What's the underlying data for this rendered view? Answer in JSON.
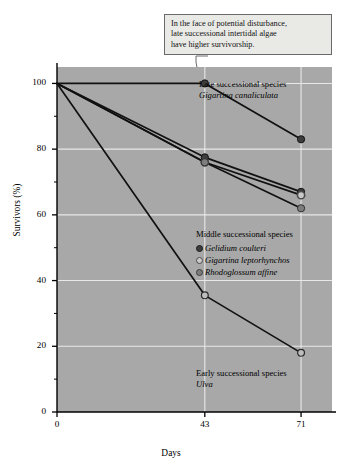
{
  "callout": {
    "name": "annotation-callout",
    "lines": [
      "In the face of potential disturbance,",
      "late successional intertidal algae",
      "have higher survivorship."
    ]
  },
  "annotations": {
    "late_heading": "Late successional species",
    "late_species": "Gigartina canaliculata",
    "middle_heading": "Middle successional species",
    "middle_species_1": "Gelidium coulteri",
    "middle_species_2": "Gigartina leptorhynchos",
    "middle_species_3": "Rhodoglossum affine",
    "early_heading": "Early successional species",
    "early_species": "Ulva"
  },
  "colors": {
    "plot_background": "#a8a8a8",
    "gridline": "#e8e8e8",
    "axis": "#000000",
    "line": "#111111",
    "marker_dark": "#3d3d3d",
    "marker_open": "#c9c9c9",
    "marker_mid": "#7d7d7d",
    "callout_background": "#e9e9e6",
    "callout_border": "#6a6a6a"
  },
  "chart_data": {
    "type": "line",
    "title": "",
    "xlabel": "Days",
    "ylabel": "Survivors (%)",
    "x": [
      0,
      43,
      71
    ],
    "xlim": [
      0,
      80
    ],
    "ylim": [
      0,
      105
    ],
    "xticks": [
      0,
      43,
      71
    ],
    "xtick_labels": [
      "0",
      "43",
      "71"
    ],
    "yticks": [
      0,
      20,
      40,
      60,
      80,
      100
    ],
    "ytick_labels": [
      "0",
      "20",
      "40",
      "60",
      "80",
      "100"
    ],
    "yminorticks": [
      10,
      30,
      50,
      70,
      90
    ],
    "grid": true,
    "grid_axis": "both",
    "legend_position": "inside-right",
    "series": [
      {
        "name": "Gigartina canaliculata",
        "group": "Late successional species",
        "marker": "filled-dark",
        "marker_color": "#3d3d3d",
        "values": [
          100,
          100,
          83
        ]
      },
      {
        "name": "Gelidium coulteri",
        "group": "Middle successional species",
        "marker": "filled-dark",
        "marker_color": "#3d3d3d",
        "values": [
          100,
          77.5,
          67
        ]
      },
      {
        "name": "Gigartina leptorhynchos",
        "group": "Middle successional species",
        "marker": "open-ring",
        "marker_color": "#c9c9c9",
        "values": [
          100,
          76,
          66
        ]
      },
      {
        "name": "Rhodoglossum affine",
        "group": "Middle successional species",
        "marker": "filled-mid",
        "marker_color": "#7d7d7d",
        "values": [
          100,
          76,
          62
        ]
      },
      {
        "name": "Ulva",
        "group": "Early successional species",
        "marker": "open-light",
        "marker_color": "#c9c9c9",
        "values": [
          100,
          35.5,
          18
        ]
      }
    ],
    "annotation": {
      "text": "In the face of potential disturbance, late successional intertidal algae have higher survivorship.",
      "points_to_series": "Gigartina canaliculata",
      "points_to_x": 43,
      "points_to_y": 100
    }
  }
}
